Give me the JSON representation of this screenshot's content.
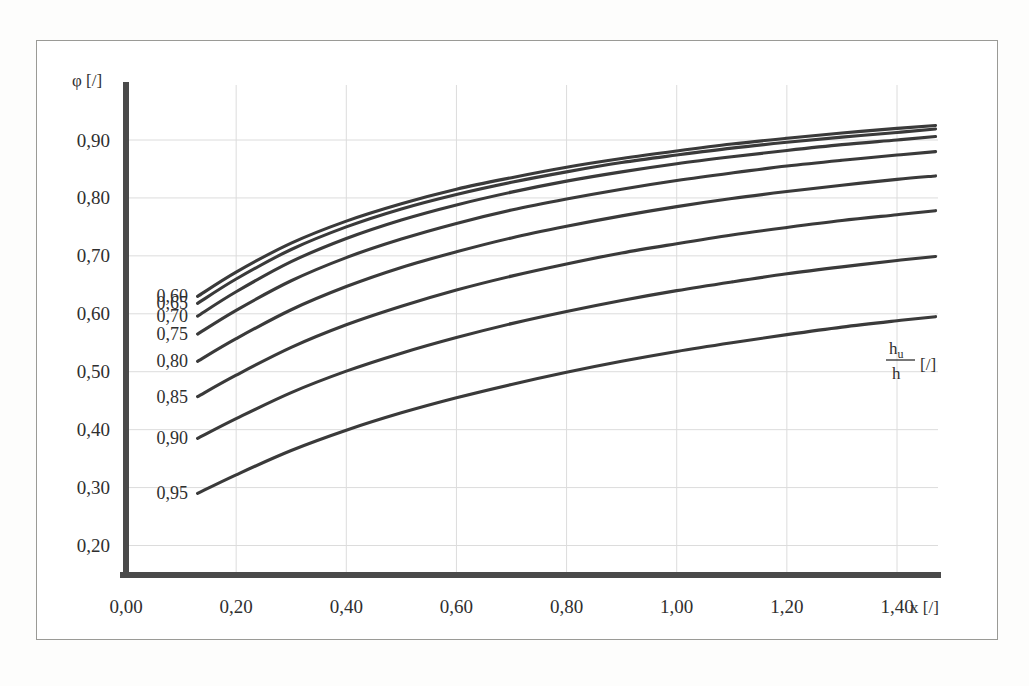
{
  "figure": {
    "background_color": "#ffffff",
    "frame_color": "#9a9a96",
    "curve_color": "#3a3a3a",
    "axis_color": "#4a4a4a",
    "grid_color": "#dcdcdc"
  },
  "axes": {
    "y_axis_label": "φ [/]",
    "x_axis_label": "x [/]",
    "family_label_numerator": "h",
    "family_label_numerator_sub": "u",
    "family_label_denominator": "h",
    "family_label_units": "[/]",
    "x_tick_labels": [
      "0,00",
      "0,20",
      "0,40",
      "0,60",
      "0,80",
      "1,00",
      "1,20",
      "1,40"
    ],
    "y_tick_labels": [
      "0,20",
      "0,30",
      "0,40",
      "0,50",
      "0,60",
      "0,70",
      "0,80",
      "0,90"
    ]
  },
  "chart_data": {
    "type": "line",
    "title": "",
    "xlabel": "x [/]",
    "ylabel": "φ [/]",
    "xlim": [
      0.0,
      1.5
    ],
    "ylim": [
      0.2,
      0.95
    ],
    "grid": true,
    "legend": "inline-curve-labels-left",
    "legend_title": "h_u / h [/]",
    "x_ticks": [
      0.0,
      0.2,
      0.4,
      0.6,
      0.8,
      1.0,
      1.2,
      1.4
    ],
    "y_ticks": [
      0.2,
      0.3,
      0.4,
      0.5,
      0.6,
      0.7,
      0.8,
      0.9
    ],
    "x": [
      0.13,
      0.2,
      0.3,
      0.4,
      0.5,
      0.6,
      0.7,
      0.8,
      0.9,
      1.0,
      1.1,
      1.2,
      1.3,
      1.4,
      1.47
    ],
    "series": [
      {
        "name": "0,60",
        "label": "0,60",
        "values": [
          0.63,
          0.672,
          0.722,
          0.76,
          0.79,
          0.815,
          0.835,
          0.853,
          0.868,
          0.881,
          0.893,
          0.903,
          0.912,
          0.92,
          0.925
        ]
      },
      {
        "name": "0,65",
        "label": "0,65",
        "values": [
          0.618,
          0.66,
          0.711,
          0.75,
          0.781,
          0.806,
          0.827,
          0.845,
          0.861,
          0.874,
          0.886,
          0.896,
          0.905,
          0.913,
          0.919
        ]
      },
      {
        "name": "0,70",
        "label": "0,70",
        "values": [
          0.596,
          0.638,
          0.69,
          0.73,
          0.762,
          0.788,
          0.81,
          0.829,
          0.845,
          0.859,
          0.871,
          0.882,
          0.892,
          0.9,
          0.906
        ]
      },
      {
        "name": "0,75",
        "label": "0,75",
        "values": [
          0.565,
          0.606,
          0.657,
          0.697,
          0.729,
          0.756,
          0.779,
          0.798,
          0.815,
          0.83,
          0.843,
          0.855,
          0.865,
          0.874,
          0.88
        ]
      },
      {
        "name": "0,80",
        "label": "0,80",
        "values": [
          0.518,
          0.557,
          0.607,
          0.647,
          0.68,
          0.707,
          0.731,
          0.751,
          0.769,
          0.785,
          0.799,
          0.811,
          0.822,
          0.832,
          0.838
        ]
      },
      {
        "name": "0,85",
        "label": "0,85",
        "values": [
          0.457,
          0.494,
          0.542,
          0.581,
          0.613,
          0.641,
          0.665,
          0.686,
          0.705,
          0.721,
          0.736,
          0.749,
          0.761,
          0.771,
          0.778
        ]
      },
      {
        "name": "0,90",
        "label": "0,90",
        "values": [
          0.385,
          0.419,
          0.464,
          0.501,
          0.532,
          0.559,
          0.583,
          0.604,
          0.623,
          0.64,
          0.655,
          0.669,
          0.681,
          0.692,
          0.699
        ]
      },
      {
        "name": "0,95",
        "label": "0,95",
        "values": [
          0.29,
          0.322,
          0.364,
          0.399,
          0.429,
          0.455,
          0.478,
          0.499,
          0.518,
          0.535,
          0.55,
          0.564,
          0.577,
          0.588,
          0.595
        ]
      }
    ],
    "curve_labels": [
      "0,60",
      "0,65",
      "0,70",
      "0,75",
      "0,80",
      "0,85",
      "0,90",
      "0,95"
    ]
  }
}
